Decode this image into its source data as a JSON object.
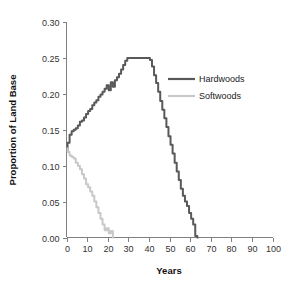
{
  "chart_data": {
    "type": "line",
    "title": "",
    "xlabel": "Years",
    "ylabel": "Proportion of Land Base",
    "xlim": [
      0,
      100
    ],
    "ylim": [
      0,
      0.3
    ],
    "grid": false,
    "legend_position": "center-right",
    "xticks": [
      0,
      10,
      20,
      30,
      40,
      50,
      60,
      70,
      80,
      90,
      100
    ],
    "xtick_labels": [
      "0",
      "10",
      "20",
      "30",
      "40",
      "50",
      "60",
      "70",
      "80",
      "90",
      "100"
    ],
    "yticks": [
      0.0,
      0.05,
      0.1,
      0.15,
      0.2,
      0.25,
      0.3
    ],
    "ytick_labels": [
      "0.00",
      "0.05",
      "0.10",
      "0.15",
      "0.20",
      "0.25",
      "0.30"
    ],
    "series": [
      {
        "name": "Hardwoods",
        "color": "#595959",
        "linewidth": 2.0,
        "x": [
          0,
          1,
          2,
          3,
          4,
          5,
          6,
          7,
          8,
          9,
          10,
          11,
          12,
          13,
          14,
          15,
          16,
          17,
          18,
          19,
          20,
          21,
          22,
          23,
          24,
          25,
          26,
          27,
          28,
          29,
          30,
          31,
          32,
          33,
          34,
          35,
          36,
          37,
          38,
          39,
          40,
          41,
          42,
          43,
          44,
          45,
          46,
          47,
          48,
          49,
          50,
          51,
          52,
          53,
          54,
          55,
          56,
          57,
          58,
          59,
          60,
          61,
          62,
          63,
          64
        ],
        "y": [
          0.12,
          0.132,
          0.143,
          0.148,
          0.15,
          0.152,
          0.156,
          0.161,
          0.163,
          0.167,
          0.172,
          0.176,
          0.179,
          0.184,
          0.188,
          0.191,
          0.196,
          0.199,
          0.203,
          0.207,
          0.212,
          0.205,
          0.216,
          0.21,
          0.219,
          0.223,
          0.228,
          0.234,
          0.24,
          0.246,
          0.25,
          0.25,
          0.25,
          0.25,
          0.25,
          0.25,
          0.25,
          0.25,
          0.25,
          0.25,
          0.25,
          0.247,
          0.238,
          0.226,
          0.215,
          0.203,
          0.19,
          0.178,
          0.166,
          0.154,
          0.141,
          0.129,
          0.117,
          0.104,
          0.092,
          0.08,
          0.068,
          0.058,
          0.05,
          0.044,
          0.034,
          0.026,
          0.018,
          0.002,
          0.0
        ]
      },
      {
        "name": "Softwoods",
        "color": "#c8c8c8",
        "linewidth": 2.0,
        "x": [
          0,
          1,
          2,
          3,
          4,
          5,
          6,
          7,
          8,
          9,
          10,
          11,
          12,
          13,
          14,
          15,
          16,
          17,
          18,
          19,
          20,
          21,
          22,
          23
        ],
        "y": [
          0.124,
          0.119,
          0.114,
          0.112,
          0.11,
          0.104,
          0.1,
          0.095,
          0.088,
          0.082,
          0.074,
          0.07,
          0.064,
          0.058,
          0.05,
          0.042,
          0.034,
          0.026,
          0.018,
          0.01,
          0.013,
          0.006,
          0.009,
          0.0
        ]
      }
    ],
    "legend_entries": [
      {
        "label": "Hardwoods",
        "color": "#595959"
      },
      {
        "label": "Softwoods",
        "color": "#c8c8c8"
      }
    ]
  },
  "axis_color": "#808080"
}
